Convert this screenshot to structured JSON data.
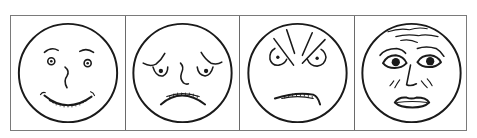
{
  "figure": {
    "colors": {
      "ink": "#1a1a1a",
      "border": "#7a7a7a",
      "background": "#ffffff"
    },
    "panels": [
      {
        "index": 1,
        "emotion": "happy",
        "features": [
          "raised eyebrows",
          "small round eyes",
          "curved nose",
          "wide toothy smile"
        ]
      },
      {
        "index": 2,
        "emotion": "sad",
        "features": [
          "drooping eyebrows",
          "droopy eyes",
          "curved nose",
          "toothy frown"
        ]
      },
      {
        "index": 3,
        "emotion": "angry",
        "features": [
          "furrowed brow lines",
          "glaring eyes",
          "clenched toothy grimace"
        ]
      },
      {
        "index": 4,
        "emotion": "afraid",
        "features": [
          "wrinkled forehead",
          "wide eyes with dark pupils",
          "tense cheek lines",
          "open parted lips"
        ]
      }
    ]
  }
}
